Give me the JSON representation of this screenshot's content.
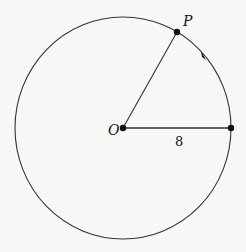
{
  "diagram": {
    "type": "circle-with-radii",
    "labels": {
      "center": "O",
      "point": "P",
      "radius_length": "8"
    },
    "colors": {
      "stroke": "#333333",
      "background": "#f7f7f5"
    },
    "direction": "counterclockwise"
  }
}
